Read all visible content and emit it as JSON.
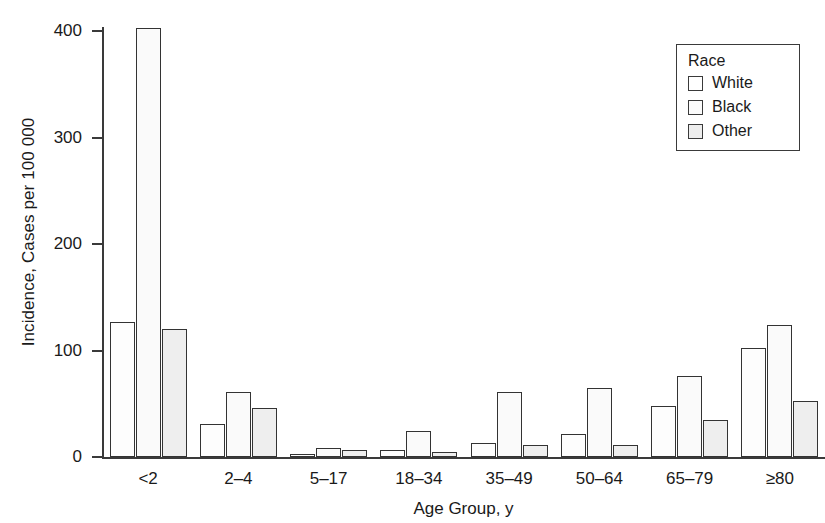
{
  "chart_data": {
    "type": "bar",
    "title": "",
    "xlabel": "Age Group, y",
    "ylabel": "Incidence, Cases per 100 000",
    "categories": [
      "<2",
      "2–4",
      "5–17",
      "18–34",
      "35–49",
      "50–64",
      "65–79",
      "≥80"
    ],
    "series": [
      {
        "name": "White",
        "values": [
          127,
          31,
          3,
          7,
          13,
          22,
          48,
          102
        ]
      },
      {
        "name": "Black",
        "values": [
          403,
          61,
          8,
          24,
          61,
          65,
          76,
          124
        ]
      },
      {
        "name": "Other",
        "values": [
          120,
          46,
          7,
          5,
          11,
          11,
          35,
          53
        ]
      }
    ],
    "ylim": [
      0,
      420
    ],
    "ytick_values": [
      0,
      100,
      200,
      300,
      400
    ],
    "ytick_labels": [
      "0",
      "100",
      "200",
      "300",
      "400"
    ],
    "grid": false,
    "legend_position": "top-right"
  },
  "legend": {
    "title": "Race",
    "entries": [
      {
        "label": "White",
        "swatch": "series-white"
      },
      {
        "label": "Black",
        "swatch": "series-black"
      },
      {
        "label": "Other",
        "swatch": "series-other"
      }
    ]
  },
  "colors": {
    "axis": "#3a3a3a",
    "bar_outline": "#333333",
    "white_fill": "#fdfdfd",
    "black_fill": "#fafafa",
    "other_fill": "#eeeeee",
    "background": "#ffffff"
  }
}
